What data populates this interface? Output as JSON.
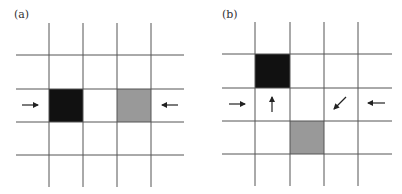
{
  "panels": [
    {
      "label": "(a)",
      "label_pos": [
        14,
        21
      ],
      "grid": {
        "v_lines": [
          49,
          83,
          117,
          151
        ],
        "h_lines": [
          55,
          89,
          122,
          155
        ],
        "x_range": [
          16,
          184
        ],
        "y_range": [
          23,
          187
        ]
      },
      "cells": [
        {
          "x": 49,
          "y": 89,
          "w": 34,
          "h": 33,
          "color": "#111111",
          "name": "black-cell"
        },
        {
          "x": 117,
          "y": 89,
          "w": 34,
          "h": 33,
          "color": "#999999",
          "name": "gray-cell"
        }
      ],
      "arrows": [
        {
          "name": "right-arrow-icon",
          "x1": 22,
          "y1": 105,
          "x2": 38,
          "y2": 105
        },
        {
          "name": "left-arrow-icon",
          "x1": 178,
          "y1": 105,
          "x2": 162,
          "y2": 105
        }
      ]
    },
    {
      "label": "(b)",
      "label_pos": [
        222,
        21
      ],
      "grid": {
        "v_lines": [
          255,
          290,
          324,
          358
        ],
        "h_lines": [
          54,
          88,
          121,
          154
        ],
        "x_range": [
          222,
          392
        ],
        "y_range": [
          22,
          186
        ]
      },
      "cells": [
        {
          "x": 255,
          "y": 54,
          "w": 35,
          "h": 34,
          "color": "#111111",
          "name": "black-cell"
        },
        {
          "x": 290,
          "y": 121,
          "w": 34,
          "h": 33,
          "color": "#999999",
          "name": "gray-cell"
        }
      ],
      "arrows": [
        {
          "name": "right-arrow-icon",
          "x1": 229,
          "y1": 104,
          "x2": 245,
          "y2": 104
        },
        {
          "name": "up-arrow-icon",
          "x1": 272,
          "y1": 112,
          "x2": 272,
          "y2": 97
        },
        {
          "name": "down-left-arrow-icon",
          "x1": 346,
          "y1": 97,
          "x2": 334,
          "y2": 109
        },
        {
          "name": "left-arrow-icon",
          "x1": 385,
          "y1": 103,
          "x2": 368,
          "y2": 103
        }
      ]
    }
  ],
  "colors": {
    "grid_line": "#555555",
    "arrow": "#222222"
  }
}
